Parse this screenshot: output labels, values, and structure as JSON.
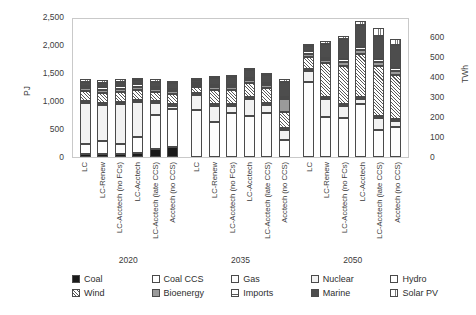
{
  "chart_data": {
    "type": "bar",
    "stacked": true,
    "title": "",
    "xlabel": "",
    "ylabel": "PJ",
    "y2label": "TWh",
    "ylim": [
      0,
      2500
    ],
    "y2lim": [
      0,
      700
    ],
    "yticks": [
      "0",
      "500",
      "1,000",
      "1,500",
      "2,000",
      "2,500"
    ],
    "y2ticks": [
      "0",
      "100",
      "200",
      "300",
      "400",
      "500",
      "600"
    ],
    "grid": false,
    "legend_position": "bottom",
    "groups": [
      "2020",
      "2035",
      "2050"
    ],
    "categories": [
      "LC",
      "LC-Renew",
      "LC-Acctech (no FCs)",
      "LC-Acctech",
      "LC-Acctech (late CCS)",
      "Acctech (no CCS)"
    ],
    "series": [
      {
        "name": "Coal",
        "pattern": "solid-black"
      },
      {
        "name": "Coal CCS",
        "pattern": "white"
      },
      {
        "name": "Gas",
        "pattern": "white"
      },
      {
        "name": "Nuclear",
        "pattern": "light-grey"
      },
      {
        "name": "Hydro",
        "pattern": "white"
      },
      {
        "name": "Wind",
        "pattern": "diagonal-hatch"
      },
      {
        "name": "Bioenergy",
        "pattern": "mid-grey"
      },
      {
        "name": "Imports",
        "pattern": "horizontal-hatch"
      },
      {
        "name": "Marine",
        "pattern": "dark-grey"
      },
      {
        "name": "Solar PV",
        "pattern": "vertical-hatch"
      }
    ],
    "values": {
      "2020": {
        "LC": {
          "Coal": 60,
          "Coal CCS": 0,
          "Gas": 170,
          "Nuclear": 740,
          "Hydro": 35,
          "Wind": 170,
          "Bioenergy": 55,
          "Imports": 40,
          "Marine": 70,
          "Solar PV": 45
        },
        "LC-Renew": {
          "Coal": 55,
          "Coal CCS": 0,
          "Gas": 230,
          "Nuclear": 650,
          "Hydro": 35,
          "Wind": 180,
          "Bioenergy": 55,
          "Imports": 40,
          "Marine": 80,
          "Solar PV": 45
        },
        "LC-Acctech (no FCs)": {
          "Coal": 60,
          "Coal CCS": 0,
          "Gas": 175,
          "Nuclear": 720,
          "Hydro": 35,
          "Wind": 175,
          "Bioenergy": 55,
          "Imports": 40,
          "Marine": 80,
          "Solar PV": 45
        },
        "LC-Acctech": {
          "Coal": 75,
          "Coal CCS": 0,
          "Gas": 275,
          "Nuclear": 640,
          "Hydro": 35,
          "Wind": 175,
          "Bioenergy": 55,
          "Imports": 40,
          "Marine": 80,
          "Solar PV": 45
        },
        "LC-Acctech (late CCS)": {
          "Coal": 150,
          "Coal CCS": 0,
          "Gas": 600,
          "Nuclear": 215,
          "Hydro": 35,
          "Wind": 160,
          "Bioenergy": 55,
          "Imports": 40,
          "Marine": 90,
          "Solar PV": 45
        },
        "Acctech (no CCS)": {
          "Coal": 185,
          "Coal CCS": 0,
          "Gas": 670,
          "Nuclear": 65,
          "Hydro": 35,
          "Wind": 170,
          "Bioenergy": 55,
          "Imports": 40,
          "Marine": 95,
          "Solar PV": 45
        }
      },
      "2035": {
        "LC": {
          "Coal": 0,
          "Coal CCS": 0,
          "Gas": 835,
          "Nuclear": 265,
          "Hydro": 35,
          "Wind": 115,
          "Bioenergy": 40,
          "Imports": 35,
          "Marine": 55,
          "Solar PV": 30
        },
        "LC-Renew": {
          "Coal": 0,
          "Coal CCS": 0,
          "Gas": 625,
          "Nuclear": 280,
          "Hydro": 35,
          "Wind": 255,
          "Bioenergy": 55,
          "Imports": 40,
          "Marine": 125,
          "Solar PV": 40
        },
        "LC-Acctech (no FCs)": {
          "Coal": 0,
          "Coal CCS": 0,
          "Gas": 790,
          "Nuclear": 120,
          "Hydro": 35,
          "Wind": 250,
          "Bioenergy": 50,
          "Imports": 40,
          "Marine": 145,
          "Solar PV": 40
        },
        "LC-Acctech": {
          "Coal": 0,
          "Coal CCS": 0,
          "Gas": 730,
          "Nuclear": 300,
          "Hydro": 35,
          "Wind": 255,
          "Bioenergy": 50,
          "Imports": 40,
          "Marine": 135,
          "Solar PV": 40
        },
        "LC-Acctech (late CCS)": {
          "Coal": 0,
          "Coal CCS": 0,
          "Gas": 790,
          "Nuclear": 140,
          "Hydro": 35,
          "Wind": 275,
          "Bioenergy": 50,
          "Imports": 40,
          "Marine": 130,
          "Solar PV": 40
        },
        "Acctech (no CCS)": {
          "Coal": 0,
          "Coal CCS": 0,
          "Gas": 295,
          "Nuclear": 190,
          "Hydro": 35,
          "Wind": 290,
          "Bioenergy": 230,
          "Imports": 40,
          "Marine": 265,
          "Solar PV": 45
        }
      },
      "2050": {
        "LC": {
          "Coal": 0,
          "Coal CCS": 0,
          "Gas": 1340,
          "Nuclear": 200,
          "Hydro": 35,
          "Wind": 215,
          "Bioenergy": 55,
          "Imports": 40,
          "Marine": 100,
          "Solar PV": 35
        },
        "LC-Renew": {
          "Coal": 0,
          "Coal CCS": 0,
          "Gas": 720,
          "Nuclear": 310,
          "Hydro": 35,
          "Wind": 610,
          "Bioenergy": 55,
          "Imports": 40,
          "Marine": 250,
          "Solar PV": 50
        },
        "LC-Acctech (no FCs)": {
          "Coal": 0,
          "Coal CCS": 0,
          "Gas": 690,
          "Nuclear": 215,
          "Hydro": 35,
          "Wind": 690,
          "Bioenergy": 70,
          "Imports": 45,
          "Marine": 370,
          "Solar PV": 55
        },
        "LC-Acctech": {
          "Coal": 0,
          "Coal CCS": 0,
          "Gas": 950,
          "Nuclear": 95,
          "Hydro": 35,
          "Wind": 760,
          "Bioenergy": 70,
          "Imports": 55,
          "Marine": 400,
          "Solar PV": 60
        },
        "LC-Acctech (late CCS)": {
          "Coal": 0,
          "Coal CCS": 0,
          "Gas": 480,
          "Nuclear": 225,
          "Hydro": 35,
          "Wind": 890,
          "Bioenergy": 70,
          "Imports": 55,
          "Marine": 400,
          "Solar PV": 155
        },
        "Acctech (no CCS)": {
          "Coal": 0,
          "Coal CCS": 0,
          "Gas": 530,
          "Nuclear": 115,
          "Hydro": 35,
          "Wind": 780,
          "Bioenergy": 75,
          "Imports": 50,
          "Marine": 420,
          "Solar PV": 95
        }
      }
    }
  }
}
